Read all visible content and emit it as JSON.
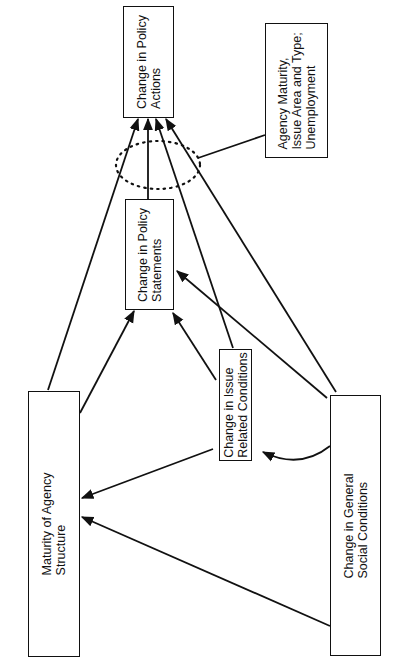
{
  "diagram": {
    "type": "causal path diagram",
    "orientation": "rotated 90 degrees counter-clockwise",
    "nodes": {
      "policy_actions": {
        "line1": "Change in Policy",
        "line2": "Actions"
      },
      "moderators": {
        "line1": "Agency Maturity,",
        "line2": "Issue Area and Type;",
        "line3": "Unemployment"
      },
      "policy_statements": {
        "line1": "Change in Policy",
        "line2": "Statements"
      },
      "issue_conditions": {
        "line1": "Change in Issue",
        "line2": "Related Conditions"
      },
      "agency_maturity": {
        "line1": "Maturity of Agency",
        "line2": "Structure"
      },
      "social_conditions": {
        "line1": "Change in General",
        "line2": "Social Conditions"
      }
    },
    "edges": [
      {
        "from": "agency_maturity",
        "to": "policy_actions"
      },
      {
        "from": "policy_statements",
        "to": "policy_actions"
      },
      {
        "from": "issue_conditions",
        "to": "policy_actions"
      },
      {
        "from": "social_conditions",
        "to": "policy_actions"
      },
      {
        "from": "agency_maturity",
        "to": "policy_statements"
      },
      {
        "from": "issue_conditions",
        "to": "policy_statements"
      },
      {
        "from": "social_conditions",
        "to": "policy_statements"
      },
      {
        "from": "issue_conditions",
        "to": "agency_maturity"
      },
      {
        "from": "social_conditions",
        "to": "agency_maturity"
      },
      {
        "from": "social_conditions",
        "to": "issue_conditions",
        "style": "curved"
      }
    ],
    "moderation": {
      "from": "moderators",
      "target": "arrows into policy_actions",
      "marker": "dotted ellipse"
    },
    "colors": {
      "ink": "#111111",
      "background": "#ffffff"
    }
  }
}
